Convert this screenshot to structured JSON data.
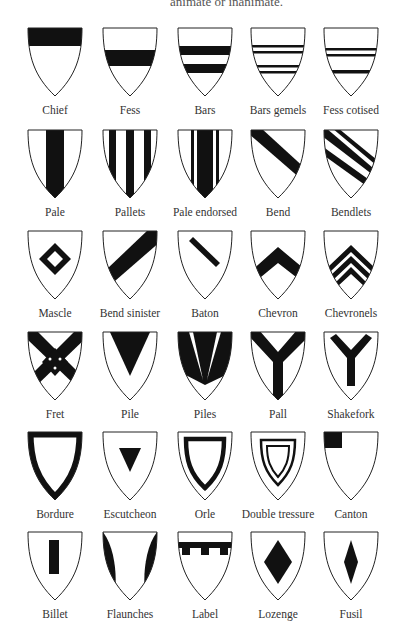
{
  "header": {
    "text": "animate or inanimate."
  },
  "colors": {
    "ink": "#111111",
    "paper": "#ffffff"
  },
  "rows": [
    [
      "Chief",
      "Fess",
      "Bars",
      "Bars gemels",
      "Fess cotised"
    ],
    [
      "Pale",
      "Pallets",
      "Pale endorsed",
      "Bend",
      "Bendlets"
    ],
    [
      "Mascle",
      "Bend sinister",
      "Baton",
      "Chevron",
      "Chevronels"
    ],
    [
      "Fret",
      "Pile",
      "Piles",
      "Pall",
      "Shakefork"
    ],
    [
      "Bordure",
      "Escutcheon",
      "Orle",
      "Double tressure",
      "Canton"
    ],
    [
      "Billet",
      "Flaunches",
      "Label",
      "Lozenge",
      "Fusil"
    ]
  ]
}
